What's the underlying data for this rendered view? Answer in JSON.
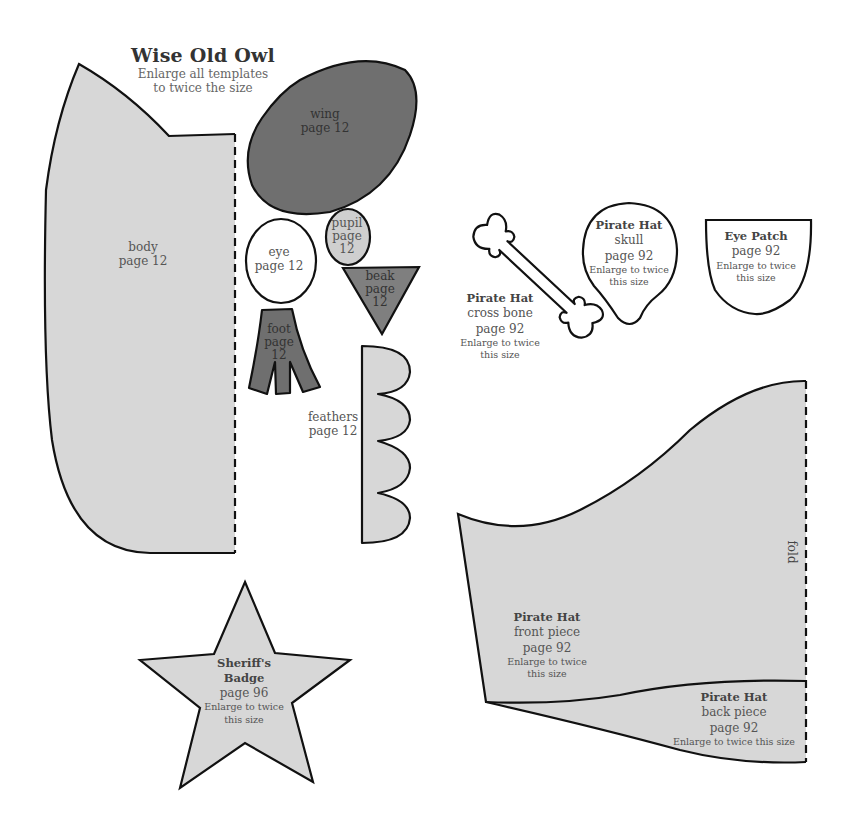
{
  "header": {
    "title": "Wise Old Owl",
    "subtitle_line1": "Enlarge all templates",
    "subtitle_line2": "to twice the size"
  },
  "colors": {
    "light_fill": "#d7d7d7",
    "dark_fill": "#6f6f6f",
    "mid_fill": "#7f7f7f",
    "pupil_fill": "#cfcfcf",
    "outline": "#111111",
    "white": "#ffffff"
  },
  "owl": {
    "body": {
      "name": "body",
      "page": "page 12"
    },
    "wing": {
      "name": "wing",
      "page": "page 12"
    },
    "eye": {
      "name": "eye",
      "page": "page 12"
    },
    "pupil": {
      "name": "pupil",
      "page": "page",
      "num": "12"
    },
    "beak": {
      "name": "beak",
      "page": "page",
      "num": "12"
    },
    "foot": {
      "name": "foot",
      "page": "page",
      "num": "12"
    },
    "feathers": {
      "name": "feathers",
      "page": "page 12"
    }
  },
  "pirate": {
    "cross_bone": {
      "title": "Pirate Hat",
      "name": "cross bone",
      "page": "page 92",
      "note1": "Enlarge to twice",
      "note2": "this size"
    },
    "skull": {
      "title": "Pirate Hat",
      "name": "skull",
      "page": "page 92",
      "note1": "Enlarge to twice",
      "note2": "this size"
    },
    "eye_patch": {
      "title": "Eye Patch",
      "page": "page 92",
      "note1": "Enlarge to twice",
      "note2": "this size"
    },
    "front_piece": {
      "title": "Pirate Hat",
      "name": "front piece",
      "page": "page 92",
      "note1": "Enlarge to twice",
      "note2": "this size"
    },
    "back_piece": {
      "title": "Pirate Hat",
      "name": "back piece",
      "page": "page 92",
      "note": "Enlarge to twice this size"
    },
    "fold_label": "fold"
  },
  "sheriff": {
    "title1": "Sheriff's",
    "title2": "Badge",
    "page": "page 96",
    "note1": "Enlarge to twice",
    "note2": "this size"
  }
}
